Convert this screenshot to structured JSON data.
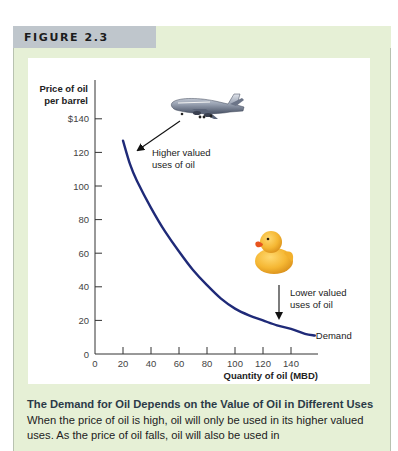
{
  "figure": {
    "label": "FIGURE 2.3",
    "colors": {
      "frame_bg": "#e6f0d6",
      "label_tab_bg": "#bfc6cc",
      "curve": "#1f2a78",
      "caption_title": "#2b3a48"
    }
  },
  "caption": {
    "title": "The Demand for Oil Depends on the Value of Oil in Different Uses",
    "body": " When the price of oil is high, oil will only be used in its higher valued uses. As the price of oil falls, oil will also be used in"
  },
  "annotations": {
    "higher": {
      "line1": "Higher valued",
      "line2": "uses of oil",
      "image": "airplane-illustration"
    },
    "lower": {
      "line1": "Lower valued",
      "line2": "uses of oil",
      "image": "rubber-duck-illustration"
    },
    "curve_label": "Demand"
  },
  "chart_data": {
    "type": "line",
    "title": "",
    "xlabel": "Quantity of oil (MBD)",
    "ylabel": "Price of oil per barrel",
    "ylabel_lines": [
      "Price of oil",
      "per barrel"
    ],
    "xlim": [
      0,
      155
    ],
    "ylim": [
      0,
      140
    ],
    "x_ticks": [
      0,
      20,
      40,
      60,
      80,
      100,
      120,
      140
    ],
    "x_tick_labels": [
      "0",
      "20",
      "40",
      "60",
      "80",
      "100",
      "120",
      "140"
    ],
    "y_ticks": [
      0,
      20,
      40,
      60,
      80,
      100,
      120,
      140
    ],
    "y_tick_labels": [
      "0",
      "20",
      "40",
      "60",
      "80",
      "100",
      "120",
      "$140"
    ],
    "grid": false,
    "legend": "none (curve labeled directly as 'Demand')",
    "series": [
      {
        "name": "Demand",
        "x": [
          20,
          25,
          30,
          40,
          50,
          60,
          70,
          80,
          90,
          100,
          110,
          120,
          130,
          140,
          150,
          157
        ],
        "y": [
          127,
          113,
          103,
          87,
          73,
          61,
          50,
          41,
          33,
          27,
          23,
          20,
          17,
          15,
          12,
          11
        ]
      }
    ]
  }
}
